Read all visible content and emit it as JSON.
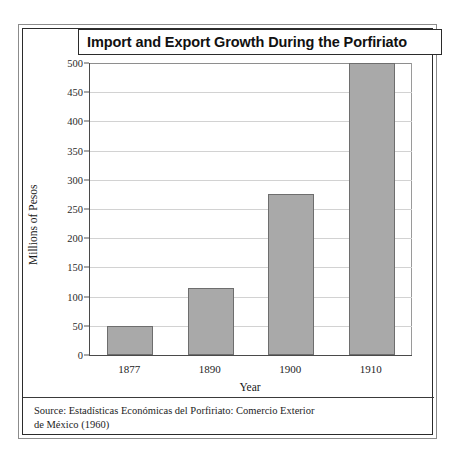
{
  "page": {
    "running_header": "THE PORFIRIATO'S GREAT LEAP FORWARD"
  },
  "figure": {
    "title": "Import and Export Growth During the Porfiriato",
    "source_line_1": "Source: Estadísticas Económicas del Porfiriato: Comercio Exterior",
    "source_line_2": "de México (1960)"
  },
  "colors": {
    "bar_fill": "#a9a9a9",
    "bar_stroke": "#6e6e6e",
    "gridline": "#d2d2d2",
    "axis": "#4a4a4a",
    "frame": "#2b2b2b"
  },
  "chart_data": {
    "type": "bar",
    "title": "Import and Export Growth During the Porfiriato",
    "xlabel": "Year",
    "ylabel": "Millions of Pesos",
    "categories": [
      "1877",
      "1890",
      "1900",
      "1910"
    ],
    "values": [
      50,
      115,
      275,
      500
    ],
    "ylim": [
      0,
      500
    ],
    "yticks": [
      0,
      50,
      100,
      150,
      200,
      250,
      300,
      350,
      400,
      450,
      500
    ],
    "ytick_labels": [
      "0",
      "50",
      "100",
      "150",
      "200",
      "250",
      "300",
      "350",
      "400",
      "450",
      "500"
    ],
    "grid": true,
    "legend": null,
    "source": "Source: Estadísticas Económicas del Porfiriato: Comercio Exterior de México (1960)"
  }
}
